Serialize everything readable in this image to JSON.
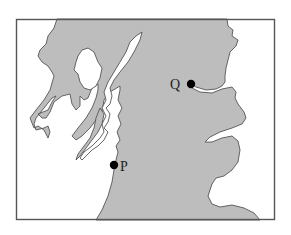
{
  "map": {
    "title": "",
    "colors": {
      "land": "#bdbdbd",
      "sea": "#ffffff",
      "coastline": "#555555",
      "frame": "#555555",
      "marker": "#000000"
    },
    "points": [
      {
        "id": "Q",
        "label": "Q",
        "x": 191,
        "y": 84
      },
      {
        "id": "P",
        "label": "P",
        "x": 114,
        "y": 165
      }
    ]
  }
}
